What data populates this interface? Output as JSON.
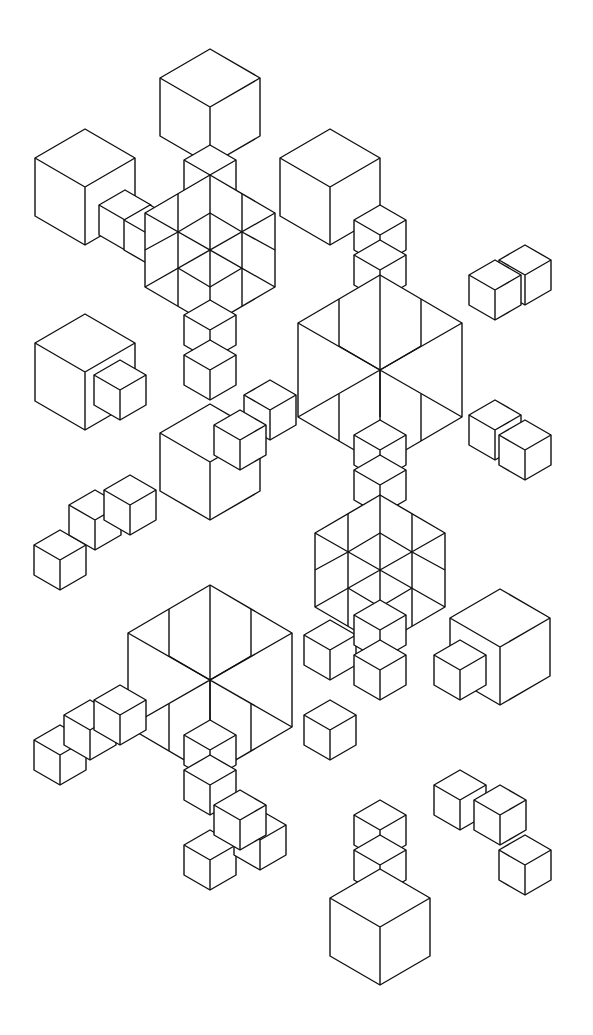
{
  "image": {
    "description": "Black line-art drawing of isometric stacked cubes forming a symmetric snowflake-like star pattern",
    "background": "#ffffff",
    "stroke": "#111111"
  }
}
